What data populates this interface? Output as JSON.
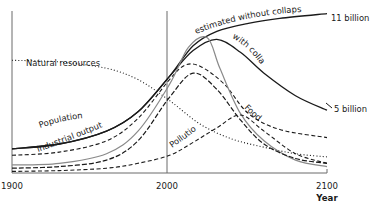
{
  "chart_data": {
    "type": "line",
    "title": "",
    "xlabel": "Year",
    "ylabel": "",
    "xlim": [
      1900,
      2100
    ],
    "ylim": [
      0,
      100
    ],
    "x_ticks": [
      "1900",
      "2000",
      "2100"
    ],
    "grid": false,
    "legend": "inline labels",
    "series": [
      {
        "name": "estimated without collapse",
        "style": "solid-black",
        "x": [
          1900,
          1930,
          1960,
          1980,
          2000,
          2015,
          2030,
          2050,
          2070,
          2100
        ],
        "y": [
          15,
          18,
          26,
          38,
          60,
          79,
          88,
          93,
          96,
          99
        ]
      },
      {
        "name": "with collapse",
        "style": "solid-black",
        "x": [
          1900,
          1930,
          1960,
          1980,
          2000,
          2015,
          2030,
          2045,
          2060,
          2080,
          2100
        ],
        "y": [
          15,
          18,
          26,
          38,
          60,
          76,
          83,
          75,
          62,
          48,
          39
        ]
      },
      {
        "name": "Natural resources",
        "style": "dotted",
        "x": [
          1900,
          1930,
          1960,
          1980,
          2000,
          2020,
          2040,
          2060,
          2080,
          2100
        ],
        "y": [
          70,
          69,
          65,
          58,
          45,
          30,
          21,
          16,
          12,
          10
        ]
      },
      {
        "name": "Food",
        "style": "dashed",
        "x": [
          1900,
          1930,
          1960,
          1980,
          2000,
          2010,
          2020,
          2035,
          2050,
          2070,
          2100
        ],
        "y": [
          11,
          13,
          20,
          34,
          58,
          67,
          66,
          55,
          37,
          27,
          22
        ]
      },
      {
        "name": "Industrial output",
        "style": "solid-gray",
        "x": [
          1900,
          1930,
          1960,
          1980,
          2000,
          2012,
          2024,
          2032,
          2045,
          2060,
          2080,
          2100
        ],
        "y": [
          5,
          6,
          12,
          26,
          55,
          78,
          84,
          65,
          37,
          20,
          8,
          4
        ]
      },
      {
        "name": "Industrial output (dashed)",
        "style": "dashed-heavy",
        "x": [
          1900,
          1930,
          1960,
          1980,
          2000,
          2015,
          2030,
          2045,
          2060,
          2080,
          2100
        ],
        "y": [
          3,
          4,
          8,
          20,
          47,
          62,
          52,
          33,
          18,
          9,
          6
        ]
      },
      {
        "name": "Pollution",
        "style": "dashed",
        "x": [
          1900,
          1930,
          1960,
          1980,
          2000,
          2015,
          2030,
          2045,
          2060,
          2080,
          2100
        ],
        "y": [
          1,
          1.5,
          3,
          6,
          11,
          19,
          28,
          36,
          26,
          12,
          6
        ]
      }
    ],
    "annotations": [
      {
        "text": "11 billion",
        "series": "estimated without collapse",
        "position": "end"
      },
      {
        "text": "5 billion",
        "series": "with collapse",
        "position": "end"
      },
      {
        "text": "Natural resources",
        "series": "Natural resources"
      },
      {
        "text": "Population",
        "series": "with collapse"
      },
      {
        "text": "Industrial output",
        "series": "Industrial output"
      },
      {
        "text": "Pollution",
        "series": "Pollution"
      },
      {
        "text": "Food",
        "series": "Food"
      },
      {
        "text": "estimated without collapse",
        "series": "estimated without collapse"
      },
      {
        "text": "with collapse",
        "series": "with collapse"
      }
    ],
    "reference_lines": [
      {
        "x": 1900
      },
      {
        "x": 2000
      }
    ]
  },
  "labels": {
    "natural_resources": "Natural resources",
    "population": "Population",
    "industrial_output": "Industrial output",
    "pollution": "Pollution",
    "food": "Food",
    "without_collapse": "estimated without collapse",
    "with_collapse": "with collapse",
    "eleven_billion": "11 billion",
    "five_billion": "5 billion"
  }
}
